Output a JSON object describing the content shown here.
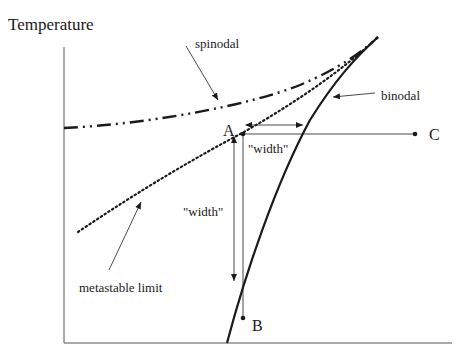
{
  "diagram": {
    "y_axis_label": "Temperature",
    "curves": {
      "spinodal": {
        "label": "spinodal",
        "style": "dash-dot-dot"
      },
      "binodal": {
        "label": "binodal",
        "style": "solid"
      },
      "metastable_limit": {
        "label": "metastable limit",
        "style": "dotted"
      }
    },
    "points": {
      "A": "A",
      "B": "B",
      "C": "C"
    },
    "width_labels": {
      "horizontal": "\"width\"",
      "vertical": "\"width\""
    },
    "colors": {
      "ink": "#1a1a1a",
      "axis": "#555555",
      "background": "#ffffff"
    }
  }
}
